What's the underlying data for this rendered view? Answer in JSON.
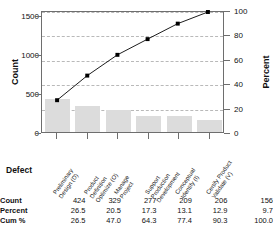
{
  "axes": {
    "left_label": "Count",
    "right_label": "Percent",
    "left_ticks": [
      "0",
      "500",
      "1000",
      "1500"
    ],
    "right_ticks": [
      "0",
      "20",
      "40",
      "60",
      "80",
      "100"
    ],
    "category_axis_label": "Defect"
  },
  "table": {
    "row_labels": [
      "Count",
      "Percent",
      "Cum %"
    ],
    "count": [
      "424",
      "329",
      "277",
      "209",
      "206",
      "156"
    ],
    "percent": [
      "26.5",
      "20.5",
      "17.3",
      "13.1",
      "12.9",
      "9.7"
    ],
    "cum_percent": [
      "26.5",
      "47.0",
      "64.3",
      "77.4",
      "90.3",
      "100.0"
    ]
  },
  "colors": {
    "bar_fill": "#dcdcdc",
    "line": "#000000",
    "marker": "#000000",
    "grid": "#b9b9b9",
    "frame": "#6e6e6e"
  },
  "chart_data": {
    "type": "bar",
    "title": "",
    "subtitle": "",
    "xlabel": "Defect",
    "ylabel": "Count",
    "y2label": "Percent",
    "grid": true,
    "legend": "none",
    "ylim": [
      0,
      1570
    ],
    "y2lim": [
      0,
      100
    ],
    "yticks": [
      0,
      500,
      1000,
      1500
    ],
    "y2ticks": [
      0,
      20,
      40,
      60,
      80,
      100
    ],
    "categories": [
      "Preliminary Design (D)",
      "Product Definition Optimize (O)",
      "Manage Project",
      "Support Production Development",
      "Conceptual Identify (I)",
      "Certify Product Validate (V)"
    ],
    "category_lines": [
      [
        "Preliminary",
        "Design (D)"
      ],
      [
        "Product",
        "Definition",
        "Optimize (O)"
      ],
      [
        "Manage",
        "Project"
      ],
      [
        "Support",
        "Production",
        "Development"
      ],
      [
        "Conceptual",
        "Identify (I)"
      ],
      [
        "Certify Product",
        "Validate (V)"
      ]
    ],
    "series": [
      {
        "name": "Count",
        "type": "bar",
        "values": [
          424,
          329,
          277,
          209,
          206,
          156
        ]
      },
      {
        "name": "Cum %",
        "type": "line",
        "axis": "y2",
        "values": [
          26.5,
          47.0,
          64.3,
          77.4,
          90.3,
          100.0
        ]
      }
    ],
    "percent": [
      26.5,
      20.5,
      17.3,
      13.1,
      12.9,
      9.7
    ],
    "total": 1601
  }
}
